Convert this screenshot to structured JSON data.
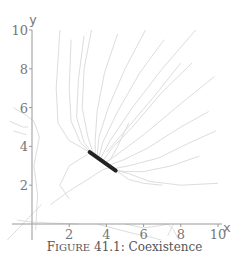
{
  "caption": {
    "prefix_cap": "F",
    "prefix_small": "IGURE",
    "number": "41.1:",
    "title": "Coexistence"
  },
  "colors": {
    "axis": "#999999",
    "trajectory": "#dddddd",
    "equilibrium": "#222222",
    "text": "#777777"
  },
  "chart_data": {
    "type": "line",
    "title": "Figure 41.1: Coexistence",
    "xlabel": "x",
    "ylabel": "y",
    "xlim": [
      -1.5,
      10.5
    ],
    "ylim": [
      -1,
      10.2
    ],
    "xticks": [
      2,
      4,
      6,
      8,
      10
    ],
    "yticks": [
      2,
      4,
      6,
      8,
      10
    ],
    "grid": false,
    "legend": null,
    "equilibrium_segment": {
      "start": [
        3.1,
        3.7
      ],
      "end": [
        4.5,
        2.75
      ]
    },
    "series": [
      {
        "name": "traj-1",
        "points": [
          [
            1.5,
            10
          ],
          [
            1.3,
            7
          ],
          [
            1.4,
            5.2
          ],
          [
            2.0,
            4.3
          ],
          [
            3.1,
            3.7
          ]
        ]
      },
      {
        "name": "traj-2",
        "points": [
          [
            2.1,
            9.5
          ],
          [
            2.0,
            7
          ],
          [
            2.1,
            5.3
          ],
          [
            2.6,
            4.2
          ],
          [
            3.2,
            3.65
          ]
        ]
      },
      {
        "name": "traj-3",
        "points": [
          [
            3.2,
            10
          ],
          [
            2.8,
            8
          ],
          [
            2.7,
            6
          ],
          [
            3.0,
            4.5
          ],
          [
            3.3,
            3.6
          ]
        ]
      },
      {
        "name": "traj-4",
        "points": [
          [
            4.6,
            9.8
          ],
          [
            3.9,
            7.8
          ],
          [
            3.5,
            5.8
          ],
          [
            3.4,
            4.3
          ],
          [
            3.4,
            3.55
          ]
        ]
      },
      {
        "name": "traj-5",
        "points": [
          [
            6.1,
            10
          ],
          [
            5.0,
            8
          ],
          [
            4.1,
            6
          ],
          [
            3.6,
            4.5
          ],
          [
            3.5,
            3.5
          ]
        ]
      },
      {
        "name": "traj-6",
        "points": [
          [
            7.1,
            9.5
          ],
          [
            5.8,
            7.8
          ],
          [
            4.6,
            5.8
          ],
          [
            3.8,
            4.2
          ],
          [
            3.6,
            3.45
          ]
        ]
      },
      {
        "name": "traj-7",
        "points": [
          [
            8.8,
            10
          ],
          [
            7.0,
            8
          ],
          [
            5.4,
            6.0
          ],
          [
            4.2,
            4.3
          ],
          [
            3.7,
            3.4
          ]
        ]
      },
      {
        "name": "traj-8",
        "points": [
          [
            8.6,
            8.3
          ],
          [
            7.0,
            6.8
          ],
          [
            5.4,
            5.0
          ],
          [
            4.3,
            3.9
          ],
          [
            3.85,
            3.3
          ]
        ]
      },
      {
        "name": "traj-9",
        "points": [
          [
            9.8,
            7.6
          ],
          [
            8.0,
            6.2
          ],
          [
            6.0,
            4.6
          ],
          [
            4.6,
            3.6
          ],
          [
            4.0,
            3.2
          ]
        ]
      },
      {
        "name": "traj-10",
        "points": [
          [
            9.5,
            5.8
          ],
          [
            8.0,
            5.0
          ],
          [
            6.2,
            3.9
          ],
          [
            4.9,
            3.3
          ],
          [
            4.2,
            3.05
          ]
        ]
      },
      {
        "name": "traj-11",
        "points": [
          [
            9.9,
            4.8
          ],
          [
            8.5,
            4.2
          ],
          [
            6.8,
            3.4
          ],
          [
            5.2,
            3.0
          ],
          [
            4.4,
            2.85
          ]
        ]
      },
      {
        "name": "traj-12",
        "points": [
          [
            10,
            2.1
          ],
          [
            8.0,
            2.0
          ],
          [
            6.3,
            2.2
          ],
          [
            5.2,
            2.6
          ],
          [
            4.6,
            2.75
          ]
        ]
      },
      {
        "name": "traj-13",
        "points": [
          [
            9.0,
            3.5
          ],
          [
            7.5,
            3.0
          ],
          [
            6.0,
            2.7
          ],
          [
            5.0,
            2.7
          ],
          [
            4.5,
            2.78
          ]
        ]
      },
      {
        "name": "traj-14",
        "points": [
          [
            1.0,
            1.0
          ],
          [
            2.0,
            1.7
          ],
          [
            3.0,
            2.3
          ],
          [
            3.8,
            2.8
          ],
          [
            4.3,
            2.95
          ]
        ]
      },
      {
        "name": "traj-15",
        "points": [
          [
            5.2,
            5.2
          ],
          [
            4.6,
            4.0
          ],
          [
            4.2,
            3.3
          ],
          [
            4.0,
            3.2
          ]
        ]
      },
      {
        "name": "traj-16",
        "points": [
          [
            2.0,
            1.3
          ],
          [
            1.5,
            2.0
          ],
          [
            2.0,
            3.0
          ],
          [
            3.0,
            3.6
          ]
        ]
      },
      {
        "name": "traj-17",
        "points": [
          [
            -1.0,
            6.0
          ],
          [
            -0.3,
            5.6
          ],
          [
            0.1,
            5.3
          ],
          [
            0.4,
            4.5
          ],
          [
            0.1,
            3.0
          ],
          [
            0.3,
            1.5
          ],
          [
            0.2,
            -0.3
          ]
        ]
      },
      {
        "name": "traj-18",
        "points": [
          [
            -1.2,
            5.3
          ],
          [
            -0.5,
            5.0
          ],
          [
            -0.2,
            5.0
          ]
        ]
      },
      {
        "name": "traj-19",
        "points": [
          [
            -1.0,
            4.8
          ],
          [
            -0.3,
            4.6
          ]
        ]
      },
      {
        "name": "traj-20",
        "points": [
          [
            -1.5,
            -1.0
          ],
          [
            -0.5,
            0.0
          ],
          [
            0.5,
            1.0
          ]
        ]
      },
      {
        "name": "traj-21",
        "points": [
          [
            5.0,
            0.0
          ],
          [
            6.0,
            -0.2
          ],
          [
            6.8,
            -0.1
          ],
          [
            7.3,
            0.0
          ],
          [
            7.6,
            -0.3
          ],
          [
            8.0,
            -1.0
          ]
        ]
      },
      {
        "name": "traj-22",
        "points": [
          [
            3.5,
            0.0
          ],
          [
            5.5,
            -0.5
          ],
          [
            6.5,
            -0.7
          ],
          [
            7.2,
            -0.9
          ]
        ]
      },
      {
        "name": "traj-23",
        "points": [
          [
            7.6,
            0.0
          ],
          [
            7.3,
            -0.6
          ]
        ]
      },
      {
        "name": "traj-24",
        "points": [
          [
            4.6,
            2.7
          ],
          [
            5.2,
            2.3
          ],
          [
            6.0,
            2.1
          ],
          [
            7.0,
            2.0
          ]
        ]
      },
      {
        "name": "traj-25",
        "points": [
          [
            8.0,
            8.3
          ],
          [
            6.5,
            6.5
          ],
          [
            5.0,
            4.8
          ],
          [
            4.0,
            3.7
          ]
        ]
      },
      {
        "name": "traj-26",
        "points": [
          [
            2.8,
            9.7
          ],
          [
            2.5,
            7.5
          ],
          [
            2.4,
            5.5
          ],
          [
            2.8,
            4.2
          ],
          [
            3.3,
            3.6
          ]
        ]
      },
      {
        "name": "traj-27",
        "points": [
          [
            -0.8,
            0.2
          ],
          [
            0.0,
            0.1
          ],
          [
            1.0,
            0.05
          ],
          [
            2.5,
            0.0
          ]
        ]
      }
    ]
  }
}
